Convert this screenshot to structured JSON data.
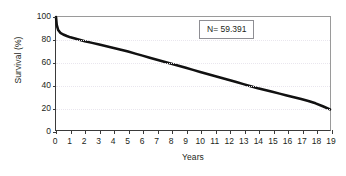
{
  "chart_data": {
    "type": "line",
    "title": "",
    "subtitle": "",
    "xlabel": "Years",
    "ylabel": "Survival (%)",
    "xlim": [
      0,
      19
    ],
    "ylim": [
      0,
      100
    ],
    "xticks": [
      "0",
      "1",
      "2",
      "3",
      "4",
      "5",
      "6",
      "7",
      "8",
      "9",
      "10",
      "11",
      "12",
      "13",
      "14",
      "15",
      "16",
      "17",
      "18",
      "19"
    ],
    "yticks": [
      "0",
      "20",
      "40",
      "60",
      "80",
      "100"
    ],
    "grid": "horizontal-dotted",
    "legend": "none",
    "annotations": [
      {
        "name": "sample-size",
        "text": "N= 59.391"
      }
    ],
    "series": [
      {
        "name": "Survival",
        "color": "#111111",
        "x": [
          0,
          0.05,
          0.15,
          0.3,
          0.5,
          0.75,
          1,
          1.5,
          2,
          2.5,
          3,
          3.5,
          4,
          4.5,
          5,
          5.5,
          6,
          6.5,
          7,
          7.5,
          8,
          8.5,
          9,
          9.5,
          10,
          10.5,
          11,
          11.5,
          12,
          12.5,
          13,
          13.5,
          14,
          14.5,
          15,
          15.5,
          16,
          16.5,
          17,
          17.5,
          18,
          18.5,
          19
        ],
        "values": [
          100,
          93,
          88.5,
          86,
          84.5,
          83.2,
          82,
          80.3,
          78.6,
          77.1,
          75.6,
          74.1,
          72.6,
          71.1,
          69.4,
          67.6,
          65.8,
          64.0,
          62.2,
          60.4,
          58.6,
          56.8,
          55.0,
          53.2,
          51.4,
          49.6,
          47.8,
          46.0,
          44.2,
          42.4,
          40.6,
          38.8,
          37.0,
          35.4,
          33.8,
          32.2,
          30.6,
          29.0,
          27.4,
          25.6,
          23.6,
          21.0,
          18.2
        ]
      }
    ]
  }
}
